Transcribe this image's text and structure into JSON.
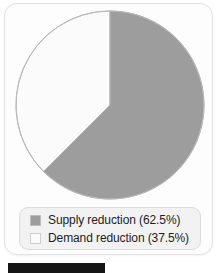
{
  "chart_data": {
    "type": "pie",
    "title": "",
    "categories": [
      "Supply reduction",
      "Demand reduction"
    ],
    "values": [
      62.5,
      37.5
    ],
    "value_unit": "%",
    "labels": [
      "Supply reduction (62.5%)",
      "Demand reduction (37.5%)"
    ],
    "colors": [
      "#9d9d9d",
      "#fbfbfb"
    ],
    "start_angle_deg": 0,
    "direction": "clockwise",
    "legend_position": "bottom",
    "grid": false,
    "slices": [
      {
        "name": "Supply reduction",
        "value": 62.5,
        "label": "Supply reduction (62.5%)",
        "color": "#9d9d9d",
        "swatch": "filled-gray-square"
      },
      {
        "name": "Demand reduction",
        "value": 37.5,
        "label": "Demand reduction (37.5%)",
        "color": "#fbfbfb",
        "swatch": "empty-white-square"
      }
    ]
  },
  "legend": {
    "rows": [
      {
        "label": "Supply reduction (62.5%)"
      },
      {
        "label": "Demand reduction (37.5%)"
      }
    ]
  },
  "colors": {
    "slice_supply": "#9d9d9d",
    "slice_demand": "#fbfbfb",
    "slice_outline": "#b4b4b4",
    "card_background": "#fdfdfd",
    "card_border": "#e2e2e2",
    "legend_background": "#f2f2f2",
    "legend_border": "#dcdcdc",
    "text": "#1d1d1d",
    "caption_band": "#151515"
  }
}
